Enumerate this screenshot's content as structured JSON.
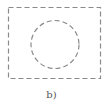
{
  "diagram": {
    "caption": "b)",
    "stroke_color": "#8a8a8a",
    "rectangle": {
      "x": 8.5,
      "y": 7.5,
      "width": 92,
      "height": 71,
      "style": "dashed"
    },
    "circle": {
      "cx": 55,
      "cy": 44.5,
      "r": 24,
      "style": "dashed"
    }
  }
}
